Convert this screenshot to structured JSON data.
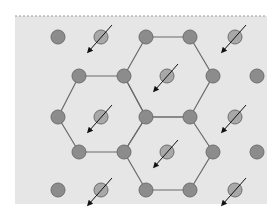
{
  "diagram": {
    "type": "hexagonal-lattice",
    "panel": {
      "x": 15,
      "y": 16,
      "width": 252,
      "height": 188,
      "fill": "#e6e6e6",
      "border_top_style": "dashed",
      "border_color": "#9a9a9a"
    },
    "colors": {
      "node_fill": "#8c8c8c",
      "node_stroke": "#6e6e6e",
      "spin_fill": "#a8a8a8",
      "edge": "#6a6a6a",
      "arrow": "#111111"
    },
    "node_radius": 7,
    "nodes": [
      {
        "id": "r1c1",
        "x": 58,
        "y": 37,
        "kind": "plain"
      },
      {
        "id": "r1c2",
        "x": 101,
        "y": 37,
        "kind": "spin"
      },
      {
        "id": "r1c3",
        "x": 146,
        "y": 37,
        "kind": "plain"
      },
      {
        "id": "r1c4",
        "x": 190,
        "y": 37,
        "kind": "plain"
      },
      {
        "id": "r1c5",
        "x": 235,
        "y": 37,
        "kind": "spin"
      },
      {
        "id": "r2c1",
        "x": 79,
        "y": 76,
        "kind": "plain"
      },
      {
        "id": "r2c2",
        "x": 124,
        "y": 76,
        "kind": "plain"
      },
      {
        "id": "r2c3",
        "x": 167,
        "y": 76,
        "kind": "spin"
      },
      {
        "id": "r2c4",
        "x": 213,
        "y": 76,
        "kind": "plain"
      },
      {
        "id": "r2c5",
        "x": 257,
        "y": 76,
        "kind": "plain"
      },
      {
        "id": "r3c1",
        "x": 58,
        "y": 117,
        "kind": "plain"
      },
      {
        "id": "r3c2",
        "x": 101,
        "y": 117,
        "kind": "spin"
      },
      {
        "id": "r3c3",
        "x": 146,
        "y": 117,
        "kind": "plain"
      },
      {
        "id": "r3c4",
        "x": 190,
        "y": 117,
        "kind": "plain"
      },
      {
        "id": "r3c5",
        "x": 235,
        "y": 117,
        "kind": "spin"
      },
      {
        "id": "r4c1",
        "x": 79,
        "y": 152,
        "kind": "plain"
      },
      {
        "id": "r4c2",
        "x": 124,
        "y": 152,
        "kind": "plain"
      },
      {
        "id": "r4c3",
        "x": 167,
        "y": 152,
        "kind": "spin"
      },
      {
        "id": "r4c4",
        "x": 213,
        "y": 152,
        "kind": "plain"
      },
      {
        "id": "r4c5",
        "x": 257,
        "y": 152,
        "kind": "plain"
      },
      {
        "id": "r5c1",
        "x": 58,
        "y": 190,
        "kind": "plain"
      },
      {
        "id": "r5c2",
        "x": 101,
        "y": 190,
        "kind": "spin"
      },
      {
        "id": "r5c3",
        "x": 146,
        "y": 190,
        "kind": "plain"
      },
      {
        "id": "r5c4",
        "x": 190,
        "y": 190,
        "kind": "plain"
      },
      {
        "id": "r5c5",
        "x": 235,
        "y": 190,
        "kind": "spin"
      }
    ],
    "hexagons": [
      {
        "id": "hex-left",
        "vertices": [
          "r2c1",
          "r2c2",
          "r3c3",
          "r4c2",
          "r4c1",
          "r3c1"
        ]
      },
      {
        "id": "hex-top",
        "vertices": [
          "r1c3",
          "r1c4",
          "r2c4",
          "r3c4",
          "r3c3",
          "r2c2"
        ]
      },
      {
        "id": "hex-bottom",
        "vertices": [
          "r3c3",
          "r3c4",
          "r4c4",
          "r5c4",
          "r5c3",
          "r4c2"
        ]
      }
    ],
    "spin_arrow": {
      "dx_tail": 11,
      "dy_tail": -12,
      "dx_head": -12,
      "dy_head": 14
    }
  }
}
